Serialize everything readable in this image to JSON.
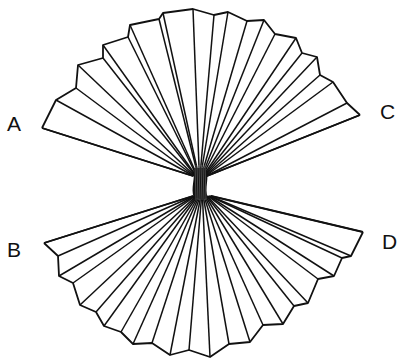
{
  "diagram": {
    "stroke_color": "#111111",
    "background": "#ffffff",
    "labels": [
      {
        "id": "A",
        "text": "A",
        "x": 7,
        "y": 113
      },
      {
        "id": "B",
        "text": "B",
        "x": 7,
        "y": 239
      },
      {
        "id": "C",
        "text": "C",
        "x": 380,
        "y": 101
      },
      {
        "id": "D",
        "text": "D",
        "x": 382,
        "y": 231
      }
    ],
    "pinch": {
      "x": 200,
      "y": 182
    },
    "upper_fan": {
      "outer_points": [
        [
          42,
          128
        ],
        [
          56,
          100
        ],
        [
          76,
          88
        ],
        [
          78,
          65
        ],
        [
          103,
          58
        ],
        [
          103,
          45
        ],
        [
          128,
          37
        ],
        [
          130,
          25
        ],
        [
          159,
          19
        ],
        [
          163,
          13
        ],
        [
          193,
          9
        ],
        [
          214,
          15
        ],
        [
          228,
          12
        ],
        [
          247,
          21
        ],
        [
          264,
          20
        ],
        [
          275,
          34
        ],
        [
          296,
          38
        ],
        [
          302,
          53
        ],
        [
          317,
          57
        ],
        [
          320,
          75
        ],
        [
          333,
          82
        ],
        [
          347,
          103
        ],
        [
          360,
          115
        ]
      ],
      "crease_count": 23
    },
    "lower_fan": {
      "outer_points": [
        [
          44,
          243
        ],
        [
          58,
          256
        ],
        [
          59,
          276
        ],
        [
          73,
          283
        ],
        [
          80,
          305
        ],
        [
          96,
          312
        ],
        [
          104,
          326
        ],
        [
          121,
          332
        ],
        [
          133,
          344
        ],
        [
          152,
          343
        ],
        [
          170,
          355
        ],
        [
          189,
          350
        ],
        [
          210,
          357
        ],
        [
          229,
          344
        ],
        [
          250,
          342
        ],
        [
          263,
          325
        ],
        [
          283,
          324
        ],
        [
          294,
          306
        ],
        [
          308,
          303
        ],
        [
          318,
          279
        ],
        [
          334,
          276
        ],
        [
          342,
          258
        ],
        [
          351,
          256
        ],
        [
          363,
          232
        ]
      ],
      "crease_count": 24
    }
  }
}
